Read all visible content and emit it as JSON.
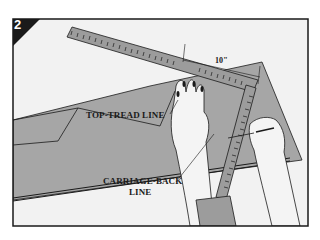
{
  "figure": {
    "step_number": "2",
    "labels": {
      "top_tread": "TOP-TREAD LINE",
      "carriage_back_line1": "CARRIAGE-BACK",
      "carriage_back_line2": "LINE",
      "measurement": "10\""
    },
    "colors": {
      "frame": "#1a1a1a",
      "background": "#f2f2f2",
      "board": "#a6a6a6",
      "tool": "#9c9c9c",
      "hand": "#f4f4f4",
      "badge": "#1a1a1a"
    }
  }
}
